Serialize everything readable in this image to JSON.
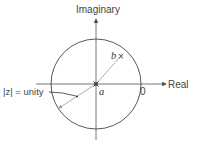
{
  "diagram": {
    "axes": {
      "vertical_label": "Imaginary",
      "horizontal_label": "Real"
    },
    "circle_label": "|z| = unity",
    "points": {
      "center_label": "a",
      "point_b_label": "b",
      "point_b_marker": "×",
      "zero_label": "0"
    },
    "colors": {
      "axis": "#555555",
      "circle": "#444444",
      "ray": "#999999",
      "text": "#444444"
    }
  }
}
